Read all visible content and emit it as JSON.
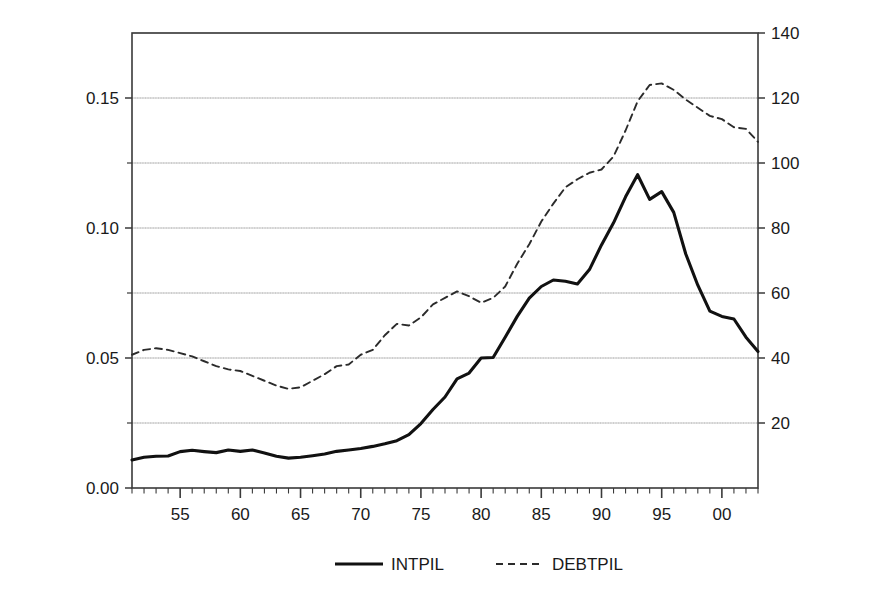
{
  "chart_data": {
    "type": "line",
    "title": "",
    "xlabel": "",
    "ylabel": "Interest outlays as % of GDP",
    "ylabel_right": "Public debt as % of GDP",
    "xlim": [
      1951,
      2003
    ],
    "ylim": [
      0.0,
      0.175
    ],
    "ylim_right": [
      0,
      140
    ],
    "grid": true,
    "legend_position": "bottom",
    "yticks": [
      "0.00",
      "0.05",
      "0.10",
      "0.15"
    ],
    "ytick_values": [
      0.0,
      0.05,
      0.1,
      0.15
    ],
    "ytick_minor_values": [
      0.025,
      0.075,
      0.125
    ],
    "yticks_right": [
      "20",
      "40",
      "60",
      "80",
      "100",
      "120",
      "140"
    ],
    "ytick_right_values": [
      20,
      40,
      60,
      80,
      100,
      120,
      140
    ],
    "xticks": [
      "55",
      "60",
      "65",
      "70",
      "75",
      "80",
      "85",
      "90",
      "95",
      "00"
    ],
    "xtick_values": [
      1955,
      1960,
      1965,
      1970,
      1975,
      1980,
      1985,
      1990,
      1995,
      2000
    ],
    "x": [
      1951,
      1952,
      1953,
      1954,
      1955,
      1956,
      1957,
      1958,
      1959,
      1960,
      1961,
      1962,
      1963,
      1964,
      1965,
      1966,
      1967,
      1968,
      1969,
      1970,
      1971,
      1972,
      1973,
      1974,
      1975,
      1976,
      1977,
      1978,
      1979,
      1980,
      1981,
      1982,
      1983,
      1984,
      1985,
      1986,
      1987,
      1988,
      1989,
      1990,
      1991,
      1992,
      1993,
      1994,
      1995,
      1996,
      1997,
      1998,
      1999,
      2000,
      2001,
      2002,
      2003
    ],
    "series": [
      {
        "name": "INTPIL",
        "style": "solid",
        "color": "#111111",
        "axis": "left",
        "values": [
          0.0108,
          0.0118,
          0.0122,
          0.0123,
          0.014,
          0.0145,
          0.014,
          0.0136,
          0.0146,
          0.0141,
          0.0146,
          0.0135,
          0.0122,
          0.0115,
          0.0118,
          0.0124,
          0.0131,
          0.0141,
          0.0146,
          0.0152,
          0.016,
          0.017,
          0.0182,
          0.0205,
          0.0248,
          0.0302,
          0.035,
          0.042,
          0.0442,
          0.05,
          0.0502,
          0.058,
          0.066,
          0.073,
          0.0775,
          0.08,
          0.0795,
          0.0785,
          0.084,
          0.0935,
          0.102,
          0.112,
          0.1205,
          0.111,
          0.114,
          0.106,
          0.09,
          0.078,
          0.068,
          0.066,
          0.065,
          0.058,
          0.0525
        ]
      },
      {
        "name": "DEBTPIL",
        "style": "dashed",
        "color": "#2b2b2b",
        "axis": "right",
        "values": [
          41.0,
          42.5,
          43.0,
          42.5,
          41.5,
          40.5,
          39.0,
          37.5,
          36.5,
          36.0,
          34.5,
          33.0,
          31.5,
          30.5,
          31.0,
          33.0,
          35.0,
          37.5,
          38.0,
          41.0,
          42.5,
          47.0,
          50.5,
          50.0,
          52.5,
          56.5,
          58.5,
          60.5,
          59.0,
          57.0,
          58.5,
          62.0,
          69.0,
          75.0,
          82.0,
          87.5,
          92.5,
          95.0,
          97.0,
          98.0,
          102.0,
          110.0,
          119.0,
          124.0,
          124.5,
          122.5,
          119.5,
          117.0,
          114.5,
          113.5,
          111.0,
          110.5,
          106.5
        ]
      }
    ]
  },
  "legend": {
    "entries": [
      {
        "label": "INTPIL",
        "style": "solid"
      },
      {
        "label": "DEBTPIL",
        "style": "dashed"
      }
    ]
  },
  "colors": {
    "series_primary": "#111111",
    "series_secondary": "#2b2b2b",
    "axis": "#3a3a3a",
    "grid_solid": "#c8c8c8",
    "grid_dotted": "#b8b8b8",
    "background": "#ffffff"
  }
}
